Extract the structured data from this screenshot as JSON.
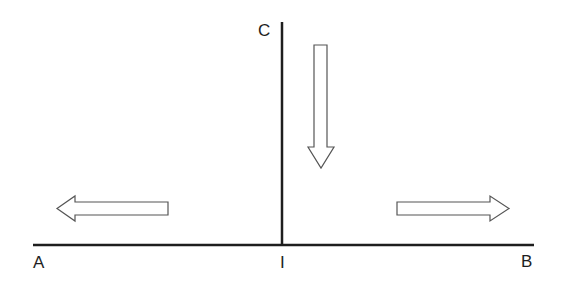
{
  "diagram": {
    "labels": {
      "left_end": "A",
      "right_end": "B",
      "top": "C",
      "intersection": "I"
    },
    "arrows": [
      {
        "id": "left",
        "direction": "left"
      },
      {
        "id": "right",
        "direction": "right"
      },
      {
        "id": "down",
        "direction": "down"
      }
    ],
    "colors": {
      "line": "#1e1e1e",
      "arrow_stroke": "#555555",
      "arrow_fill": "#ffffff",
      "background": "#ffffff"
    }
  }
}
